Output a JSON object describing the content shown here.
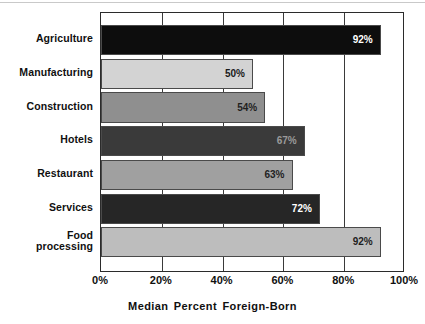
{
  "chart_data": {
    "type": "bar",
    "orientation": "horizontal",
    "title": "",
    "xlabel": "Median Percent Foreign-Born",
    "ylabel": "",
    "xlim": [
      0,
      100
    ],
    "grid": true,
    "legend": "none",
    "x_tick_labels": [
      "0%",
      "20%",
      "40%",
      "60%",
      "80%",
      "100%"
    ],
    "x_tick_values": [
      0,
      20,
      40,
      60,
      80,
      100
    ],
    "categories": [
      "Agriculture",
      "Manufacturing",
      "Construction",
      "Hotels",
      "Restaurant",
      "Services",
      "Food\nprocessing"
    ],
    "values": [
      92,
      50,
      54,
      67,
      63,
      72,
      92
    ],
    "value_labels": [
      "92%",
      "50%",
      "54%",
      "67%",
      "63%",
      "72%",
      "92%"
    ],
    "bar_colors": [
      "#0d0d0d",
      "#d3d3d3",
      "#8f8f8f",
      "#3a3a3a",
      "#a0a0a0",
      "#262626",
      "#bdbdbd"
    ],
    "label_colors": [
      "#ffffff",
      "#1a1a1a",
      "#1f1f1f",
      "#9a9a9a",
      "#1f1f1f",
      "#ffffff",
      "#1f1f1f"
    ]
  },
  "axis": {
    "title": "Median Percent Foreign-Born"
  }
}
